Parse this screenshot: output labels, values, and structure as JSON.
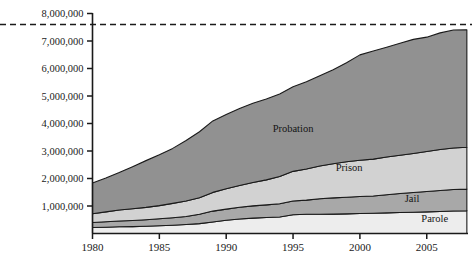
{
  "chart_data": {
    "type": "area",
    "title": "",
    "subtitle": "",
    "xlabel": "",
    "ylabel": "",
    "stacked": true,
    "grid": false,
    "legend_position": "inline-labels",
    "xlim": [
      1980,
      2008
    ],
    "ylim": [
      0,
      8000000
    ],
    "x_tick_labels": [
      "1980",
      "1985",
      "1990",
      "1995",
      "2000",
      "2005"
    ],
    "x_ticks": [
      1980,
      1985,
      1990,
      1995,
      2000,
      2005
    ],
    "y_tick_labels": [
      "1,000,000",
      "2,000,000",
      "3,000,000",
      "4,000,000",
      "5,000,000",
      "6,000,000",
      "7,000,000",
      "8,000,000"
    ],
    "y_ticks": [
      1000000,
      2000000,
      3000000,
      4000000,
      5000000,
      6000000,
      7000000,
      8000000
    ],
    "annotations": [
      {
        "name": "reference-line",
        "type": "dashed-horizontal",
        "value": 7600000,
        "color": "#1a1a1a"
      }
    ],
    "x": [
      1980,
      1981,
      1982,
      1983,
      1984,
      1985,
      1986,
      1987,
      1988,
      1989,
      1990,
      1991,
      1992,
      1993,
      1994,
      1995,
      1996,
      1997,
      1998,
      1999,
      2000,
      2001,
      2002,
      2003,
      2004,
      2005,
      2006,
      2007,
      2008
    ],
    "series": [
      {
        "name": "Parole",
        "color": "#ededed",
        "label_x": 2005.6,
        "label_y": 420000,
        "values": [
          220000,
          230000,
          245000,
          250000,
          265000,
          280000,
          300000,
          325000,
          360000,
          420000,
          480000,
          530000,
          560000,
          580000,
          600000,
          680000,
          700000,
          700000,
          705000,
          715000,
          725000,
          735000,
          750000,
          765000,
          775000,
          785000,
          800000,
          820000,
          830000
        ]
      },
      {
        "name": "Jail",
        "color": "#a8a8a8",
        "label_x": 2003.9,
        "label_y": 1150000,
        "values": [
          180000,
          195000,
          210000,
          225000,
          235000,
          255000,
          275000,
          295000,
          340000,
          395000,
          405000,
          425000,
          445000,
          460000,
          480000,
          500000,
          515000,
          565000,
          590000,
          605000,
          620000,
          630000,
          660000,
          690000,
          715000,
          745000,
          765000,
          780000,
          785000
        ]
      },
      {
        "name": "Prison",
        "color": "#d2d2d2",
        "label_x": 1999.2,
        "label_y": 2280000,
        "values": [
          320000,
          360000,
          400000,
          425000,
          450000,
          480000,
          520000,
          560000,
          600000,
          680000,
          740000,
          790000,
          850000,
          910000,
          990000,
          1080000,
          1130000,
          1190000,
          1240000,
          1290000,
          1320000,
          1340000,
          1370000,
          1390000,
          1420000,
          1450000,
          1490000,
          1510000,
          1520000
        ]
      },
      {
        "name": "Probation",
        "color": "#919191",
        "label_x": 1995.0,
        "label_y": 3700000,
        "values": [
          1120000,
          1230000,
          1360000,
          1530000,
          1700000,
          1850000,
          2000000,
          2200000,
          2400000,
          2600000,
          2700000,
          2800000,
          2880000,
          2940000,
          3000000,
          3080000,
          3170000,
          3280000,
          3420000,
          3600000,
          3830000,
          3930000,
          3995000,
          4070000,
          4150000,
          4160000,
          4240000,
          4290000,
          4270000
        ]
      }
    ]
  },
  "axis": {
    "y_label_0": "1,000,000",
    "y_label_1": "2,000,000",
    "y_label_2": "3,000,000",
    "y_label_3": "4,000,000",
    "y_label_4": "5,000,000",
    "y_label_5": "6,000,000",
    "y_label_6": "7,000,000",
    "y_label_7": "8,000,000",
    "x_label_0": "1980",
    "x_label_1": "1985",
    "x_label_2": "1990",
    "x_label_3": "1995",
    "x_label_4": "2000",
    "x_label_5": "2005"
  },
  "series_labels": {
    "probation": "Probation",
    "prison": "Prison",
    "jail": "Jail",
    "parole": "Parole"
  }
}
